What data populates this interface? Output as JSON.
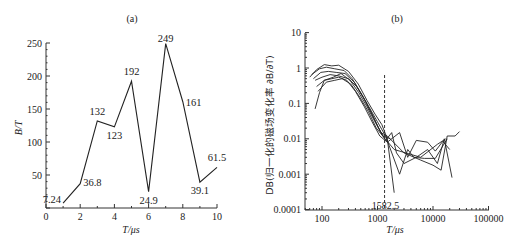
{
  "chart_data": [
    {
      "panel": "(a)",
      "type": "line",
      "title": "(a)",
      "xlabel": "T/μs",
      "ylabel": "B/T",
      "xlim": [
        0,
        10
      ],
      "ylim": [
        0,
        250
      ],
      "xticks": [
        0,
        2,
        4,
        6,
        8,
        10
      ],
      "yticks": [
        50,
        100,
        150,
        200,
        250
      ],
      "grid": false,
      "x": [
        1,
        2,
        3,
        4,
        5,
        6,
        7,
        8,
        9,
        10
      ],
      "values": [
        7.24,
        36.8,
        132,
        123,
        192,
        24.9,
        249,
        161,
        39.1,
        61.5
      ],
      "data_labels": [
        "7.24",
        "36.8",
        "132",
        "123",
        "192",
        "24.9",
        "249",
        "161",
        "39.1",
        "61.5"
      ]
    },
    {
      "panel": "(b)",
      "type": "line",
      "title": "(b)",
      "xlabel": "T/μs",
      "ylabel": "DB(归一化的磁场变化率 ∂B/∂T)",
      "xscale": "log",
      "yscale": "log",
      "xlim": [
        55,
        100000
      ],
      "ylim": [
        0.0001,
        10
      ],
      "xticks": [
        "100",
        "1000",
        "10000",
        "100000"
      ],
      "yticks": [
        "0.0001",
        "0.001",
        "0.01",
        "0.1",
        "1",
        "10"
      ],
      "grid": false,
      "annotations": [
        {
          "type": "vline",
          "x": 1582.5,
          "style": "dashed",
          "label": "1582.5"
        }
      ],
      "series": [
        {
          "name": "curve-1",
          "points": [
            [
              60,
              0.55
            ],
            [
              80,
              0.9
            ],
            [
              110,
              1.25
            ],
            [
              150,
              1.15
            ],
            [
              200,
              1.2
            ],
            [
              300,
              0.8
            ],
            [
              450,
              0.35
            ],
            [
              650,
              0.12
            ],
            [
              900,
              0.05
            ],
            [
              1200,
              0.025
            ],
            [
              1500,
              0.01
            ],
            [
              2000,
              0.0003
            ]
          ]
        },
        {
          "name": "curve-2",
          "points": [
            [
              65,
              0.65
            ],
            [
              90,
              0.95
            ],
            [
              120,
              1.05
            ],
            [
              170,
              0.95
            ],
            [
              250,
              0.85
            ],
            [
              350,
              0.5
            ],
            [
              500,
              0.2
            ],
            [
              700,
              0.08
            ],
            [
              1000,
              0.03
            ],
            [
              1400,
              0.012
            ],
            [
              2500,
              0.001
            ],
            [
              3500,
              0.005
            ],
            [
              4500,
              0.003
            ],
            [
              7000,
              0.0028
            ],
            [
              11000,
              0.0028
            ],
            [
              18000,
              0.01
            ]
          ]
        },
        {
          "name": "curve-3",
          "points": [
            [
              70,
              0.5
            ],
            [
              95,
              0.75
            ],
            [
              130,
              0.8
            ],
            [
              180,
              0.75
            ],
            [
              260,
              0.7
            ],
            [
              380,
              0.4
            ],
            [
              550,
              0.15
            ],
            [
              750,
              0.06
            ],
            [
              1050,
              0.02
            ],
            [
              1400,
              0.009
            ],
            [
              1800,
              0.015
            ],
            [
              2200,
              0.004
            ],
            [
              3000,
              0.002
            ],
            [
              5000,
              0.003
            ],
            [
              8000,
              0.005
            ],
            [
              12000,
              0.002
            ],
            [
              16000,
              0.01
            ],
            [
              22000,
              0.0008
            ]
          ]
        },
        {
          "name": "curve-4",
          "points": [
            [
              75,
              0.45
            ],
            [
              100,
              0.55
            ],
            [
              140,
              0.65
            ],
            [
              200,
              0.6
            ],
            [
              300,
              0.5
            ],
            [
              420,
              0.3
            ],
            [
              600,
              0.12
            ],
            [
              850,
              0.04
            ],
            [
              1150,
              0.015
            ],
            [
              1500,
              0.012
            ],
            [
              3000,
              0.004
            ],
            [
              6000,
              0.0025
            ],
            [
              10000,
              0.0018
            ],
            [
              14000,
              0.0013
            ],
            [
              18000,
              0.012
            ],
            [
              25000,
              0.012
            ],
            [
              30000,
              0.016
            ]
          ]
        },
        {
          "name": "curve-5",
          "points": [
            [
              80,
              0.3
            ],
            [
              110,
              0.45
            ],
            [
              150,
              0.5
            ],
            [
              200,
              0.55
            ],
            [
              280,
              0.45
            ],
            [
              400,
              0.22
            ],
            [
              580,
              0.08
            ],
            [
              800,
              0.03
            ],
            [
              1100,
              0.012
            ],
            [
              1500,
              0.008
            ],
            [
              2500,
              0.015
            ],
            [
              3500,
              0.003
            ],
            [
              5000,
              0.009
            ],
            [
              8000,
              0.008
            ],
            [
              11000,
              0.0045
            ],
            [
              15000,
              0.0085
            ],
            [
              20000,
              0.005
            ]
          ]
        },
        {
          "name": "curve-6",
          "points": [
            [
              85,
              0.22
            ],
            [
              120,
              0.4
            ],
            [
              170,
              0.45
            ],
            [
              230,
              0.5
            ],
            [
              330,
              0.35
            ],
            [
              480,
              0.15
            ],
            [
              680,
              0.06
            ],
            [
              950,
              0.02
            ],
            [
              1300,
              0.011
            ],
            [
              2000,
              0.005
            ],
            [
              6000,
              0.003
            ],
            [
              12000,
              0.007
            ],
            [
              17000,
              0.01
            ]
          ]
        },
        {
          "name": "curve-7",
          "points": [
            [
              75,
              0.07
            ],
            [
              90,
              0.2
            ],
            [
              110,
              0.45
            ],
            [
              160,
              0.55
            ],
            [
              220,
              0.7
            ],
            [
              320,
              0.45
            ],
            [
              460,
              0.2
            ],
            [
              650,
              0.08
            ],
            [
              900,
              0.03
            ],
            [
              1250,
              0.012
            ],
            [
              1700,
              0.01
            ]
          ]
        }
      ]
    }
  ]
}
